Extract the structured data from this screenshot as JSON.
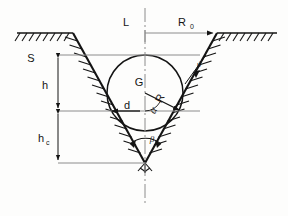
{
  "figure": {
    "background_color": "#fdfdfc",
    "line_color": "#141414"
  },
  "labels": {
    "centerline": "L",
    "top_radius": "R",
    "top_radius_sub": "0",
    "surface": "S",
    "depth": "h",
    "depth_c": "h",
    "depth_c_sub": "c",
    "half_width": "d",
    "circle": "G",
    "radius": "R",
    "angle_alpha": "α",
    "angle_beta": "β",
    "angle_theta": "ϑ"
  },
  "geometry": {
    "ground_left_y": 33,
    "ground_right_y": 33,
    "ground_left_x1": 17,
    "ground_left_x2": 73,
    "ground_right_x1": 217,
    "ground_right_x2": 277,
    "slope_left_top_x": 73,
    "slope_right_top_x": 217,
    "vertex_x": 145,
    "vertex_y": 163,
    "surface_line_y": 55,
    "d_line_y": 111,
    "circle_cx": 145,
    "circle_cy": 93,
    "circle_r": 38,
    "dim_x": 58,
    "d_left_x": 110,
    "d_right_x": 181
  },
  "elements": {
    "hatching": "ground-and-slope-hatching",
    "centerline_style": "dash-dot",
    "circle_label_position": "inside-upper"
  }
}
